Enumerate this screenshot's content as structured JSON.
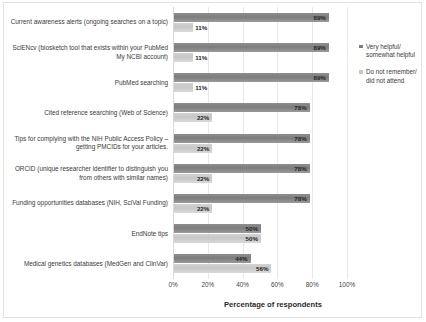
{
  "chart_data": {
    "type": "bar",
    "orientation": "horizontal",
    "title": "",
    "xlabel": "Percentage of respondents",
    "ylabel": "",
    "xlim": [
      0,
      100
    ],
    "xticks": [
      "0%",
      "20%",
      "40%",
      "60%",
      "80%",
      "100%"
    ],
    "xtick_values": [
      0,
      20,
      40,
      60,
      80,
      100
    ],
    "grid": true,
    "legend_position": "right",
    "categories": [
      "Current awareness alerts (ongoing searches on a topic)",
      "SciENcv (biosketch tool that exists within your PubMed My NCBI account)",
      "PubMed searching",
      "Cited reference searching (Web of Science)",
      "Tips for complying with the NIH Public Access Policy – getting PMCIDs for your articles.",
      "ORCID (unique researcher identifier to distinguish you from others with similar names)",
      "Funding opportunities databases (NIH, SciVal Funding)",
      "EndNote tips",
      "Medical genetics databases (MedGen and ClinVar)"
    ],
    "series": [
      {
        "name": "Very helpful/ somewhat helpful",
        "color": "#7d7d7d",
        "values": [
          89,
          89,
          89,
          78,
          78,
          78,
          78,
          50,
          44
        ],
        "labels": [
          "89%",
          "89%",
          "89%",
          "78%",
          "78%",
          "78%",
          "78%",
          "50%",
          "44%"
        ]
      },
      {
        "name": "Do not remember/ did not attend",
        "color": "#c9c9c9",
        "values": [
          11,
          11,
          11,
          22,
          22,
          22,
          22,
          50,
          56
        ],
        "labels": [
          "11%",
          "11%",
          "11%",
          "22%",
          "22%",
          "22%",
          "22%",
          "50%",
          "56%"
        ]
      }
    ]
  },
  "legend": {
    "items": [
      {
        "label": "Very helpful/ somewhat helpful"
      },
      {
        "label": "Do not remember/ did not attend"
      }
    ]
  }
}
